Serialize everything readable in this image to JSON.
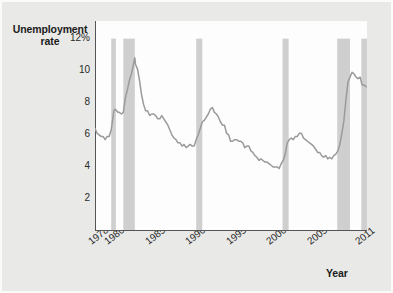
{
  "chart_data": {
    "type": "line",
    "title": "",
    "subtitle": "",
    "xlabel": "Year",
    "ylabel": "Unemployment rate",
    "ylabel_lines": [
      "Unemployment",
      "rate"
    ],
    "grid": false,
    "legend_position": "none",
    "xlim": [
      1978,
      2011.6
    ],
    "ylim": [
      0,
      13.1
    ],
    "y_ticks": [
      2,
      4,
      6,
      8,
      10,
      12
    ],
    "y_tick_labels": [
      "2",
      "4",
      "6",
      "8",
      "10",
      "12%"
    ],
    "x_ticks": [
      1978,
      1980,
      1985,
      1990,
      1995,
      2000,
      2005,
      2011
    ],
    "x_tick_labels": [
      "1978",
      "1980",
      "1985",
      "1990",
      "1995",
      "2000",
      "2005",
      "2011"
    ],
    "line_color": "#9a9a9a",
    "shade_color": "#cfcfcf",
    "plot_background": "#fdfdfd",
    "figure_background": "#e9e9e7",
    "units": "percent",
    "series": [
      {
        "name": "Unemployment rate",
        "x": [
          1978.0,
          1978.25,
          1978.5,
          1978.75,
          1979.0,
          1979.25,
          1979.5,
          1979.75,
          1980.0,
          1980.17,
          1980.33,
          1980.5,
          1980.67,
          1980.83,
          1981.0,
          1981.25,
          1981.5,
          1981.75,
          1982.0,
          1982.25,
          1982.5,
          1982.75,
          1982.92,
          1983.0,
          1983.25,
          1983.5,
          1983.75,
          1984.0,
          1984.25,
          1984.5,
          1984.75,
          1985.0,
          1985.25,
          1985.5,
          1985.75,
          1986.0,
          1986.25,
          1986.5,
          1986.75,
          1987.0,
          1987.25,
          1987.5,
          1987.75,
          1988.0,
          1988.25,
          1988.5,
          1988.75,
          1989.0,
          1989.25,
          1989.5,
          1989.75,
          1990.0,
          1990.25,
          1990.5,
          1990.75,
          1991.0,
          1991.25,
          1991.5,
          1991.75,
          1992.0,
          1992.25,
          1992.5,
          1992.75,
          1993.0,
          1993.25,
          1993.5,
          1993.75,
          1994.0,
          1994.25,
          1994.5,
          1994.75,
          1995.0,
          1995.25,
          1995.5,
          1995.75,
          1996.0,
          1996.25,
          1996.5,
          1996.75,
          1997.0,
          1997.25,
          1997.5,
          1997.75,
          1998.0,
          1998.25,
          1998.5,
          1998.75,
          1999.0,
          1999.25,
          1999.5,
          1999.75,
          2000.0,
          2000.25,
          2000.5,
          2000.75,
          2001.0,
          2001.25,
          2001.5,
          2001.75,
          2002.0,
          2002.25,
          2002.5,
          2002.75,
          2003.0,
          2003.25,
          2003.5,
          2003.75,
          2004.0,
          2004.25,
          2004.5,
          2004.75,
          2005.0,
          2005.25,
          2005.5,
          2005.75,
          2006.0,
          2006.25,
          2006.5,
          2006.75,
          2007.0,
          2007.25,
          2007.5,
          2007.75,
          2008.0,
          2008.25,
          2008.5,
          2008.75,
          2009.0,
          2009.25,
          2009.5,
          2009.75,
          2010.0,
          2010.25,
          2010.5,
          2010.75,
          2011.0,
          2011.25,
          2011.5
        ],
        "y": [
          6.4,
          6.1,
          6.0,
          5.9,
          5.9,
          5.7,
          5.9,
          5.9,
          6.3,
          6.9,
          7.5,
          7.6,
          7.5,
          7.4,
          7.4,
          7.3,
          7.4,
          8.3,
          8.8,
          9.4,
          9.8,
          10.4,
          10.8,
          10.4,
          10.1,
          9.4,
          8.5,
          7.9,
          7.5,
          7.5,
          7.2,
          7.3,
          7.3,
          7.2,
          7.0,
          7.0,
          7.2,
          7.0,
          6.8,
          6.6,
          6.3,
          6.0,
          5.8,
          5.7,
          5.5,
          5.5,
          5.3,
          5.4,
          5.2,
          5.3,
          5.4,
          5.3,
          5.3,
          5.7,
          6.0,
          6.4,
          6.8,
          6.9,
          7.1,
          7.3,
          7.6,
          7.7,
          7.4,
          7.3,
          7.1,
          6.8,
          6.6,
          6.6,
          6.1,
          6.0,
          5.6,
          5.6,
          5.7,
          5.7,
          5.6,
          5.6,
          5.5,
          5.2,
          5.3,
          5.3,
          5.0,
          4.9,
          4.7,
          4.6,
          4.4,
          4.5,
          4.4,
          4.3,
          4.3,
          4.2,
          4.1,
          4.0,
          4.0,
          4.0,
          3.9,
          4.2,
          4.4,
          4.8,
          5.5,
          5.7,
          5.8,
          5.7,
          5.9,
          5.9,
          6.1,
          6.1,
          5.8,
          5.7,
          5.6,
          5.5,
          5.4,
          5.3,
          5.1,
          4.9,
          4.9,
          4.7,
          4.6,
          4.7,
          4.5,
          4.6,
          4.5,
          4.7,
          4.8,
          5.0,
          5.4,
          6.1,
          6.9,
          8.2,
          9.3,
          9.6,
          9.9,
          9.8,
          9.6,
          9.5,
          9.6,
          9.1,
          9.1,
          9.0
        ]
      }
    ],
    "recession_bands": [
      {
        "label": "1980 recession",
        "start": 1980.0,
        "end": 1980.58
      },
      {
        "label": "1981-82 recession",
        "start": 1981.5,
        "end": 1982.92
      },
      {
        "label": "1990-91 recession",
        "start": 1990.5,
        "end": 1991.25
      },
      {
        "label": "2001 recession",
        "start": 2001.17,
        "end": 2001.92
      },
      {
        "label": "2007-09 recession",
        "start": 2007.92,
        "end": 2009.5
      },
      {
        "label": "edge band",
        "start": 2010.9,
        "end": 2011.6
      }
    ]
  }
}
